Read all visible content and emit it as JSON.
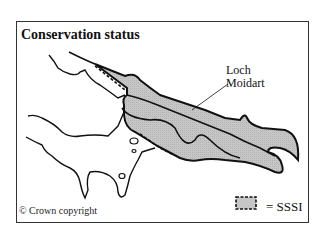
{
  "map": {
    "title": "Conservation status",
    "place_label_line1": "Loch",
    "place_label_line2": "Moidart",
    "copyright": "© Crown copyright",
    "legend": {
      "symbol": "shaded area with dashed boundary",
      "text": "= SSSI",
      "fill_color": "#c8c8c8"
    }
  }
}
